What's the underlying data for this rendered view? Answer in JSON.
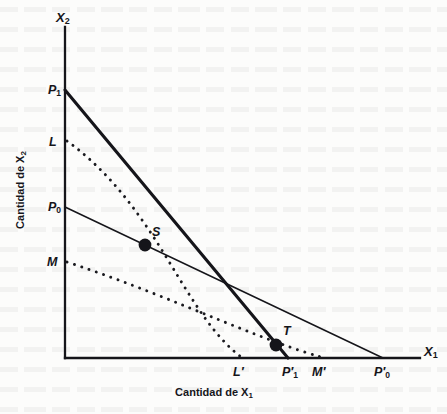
{
  "figure": {
    "kind": "economics-indifference-curve-diagram",
    "background_color": "#fcfcfb",
    "ink_color": "#15151a"
  },
  "axes": {
    "x_axis_variable": "X",
    "x_axis_variable_sub": "1",
    "y_axis_variable": "X",
    "y_axis_variable_sub": "2",
    "x_axis_title": "Cantidad de X",
    "x_axis_title_sub": "1",
    "y_axis_title": "Cantidad de X",
    "y_axis_title_sub": "2",
    "origin_px": [
      65,
      358
    ],
    "x_axis_end_px": [
      420,
      358
    ],
    "y_axis_top_px": [
      65,
      27
    ]
  },
  "y_marks": [
    {
      "id": "P1",
      "label": "P",
      "sub": "1",
      "prime": "",
      "x": 48,
      "y": 84
    },
    {
      "id": "L",
      "label": "L",
      "sub": "",
      "prime": "",
      "x": 49,
      "y": 136
    },
    {
      "id": "P0",
      "label": "P",
      "sub": "0",
      "prime": "",
      "x": 48,
      "y": 201
    },
    {
      "id": "M",
      "label": "M",
      "sub": "",
      "prime": "",
      "x": 47,
      "y": 256
    }
  ],
  "x_marks": [
    {
      "id": "Lp",
      "label": "L",
      "sub": "",
      "prime": "′",
      "x": 233,
      "y": 366
    },
    {
      "id": "P1p",
      "label": "P",
      "sub": "1",
      "prime": "′",
      "x": 282,
      "y": 366
    },
    {
      "id": "Mp",
      "label": "M",
      "sub": "",
      "prime": "′",
      "x": 312,
      "y": 366
    },
    {
      "id": "P0p",
      "label": "P",
      "sub": "0",
      "prime": "′",
      "x": 374,
      "y": 366
    }
  ],
  "budget_lines": [
    {
      "name": "budget-line-P1",
      "label": "P1 P1-prime",
      "from_px": [
        65,
        90
      ],
      "to_px": [
        288,
        358
      ],
      "stroke_width": 3.1,
      "color": "#15151a"
    },
    {
      "name": "budget-line-P0",
      "label": "P0 P0-prime",
      "from_px": [
        65,
        207
      ],
      "to_px": [
        383,
        358
      ],
      "stroke_width": 1.5,
      "color": "#15151a"
    }
  ],
  "indifference_curves": [
    {
      "name": "indifference-curve-L",
      "label": "L L-prime",
      "path": "M 67,141 C 110,172 140,214 168,260 C 196,306 214,336 241,357",
      "dash": "0.1,7.2",
      "stroke_width": 2.9,
      "color": "#1a1a1f"
    },
    {
      "name": "indifference-curve-M",
      "label": "M M-prime",
      "path": "M 67,262 C 128,282 177,303 222,321 C 264,338 296,350 321,357",
      "dash": "0.1,7.6",
      "stroke_width": 2.9,
      "color": "#1a1a1f"
    }
  ],
  "points": [
    {
      "id": "S",
      "label": "S",
      "cx": 145,
      "cy": 245,
      "r": 6.4,
      "label_x": 152,
      "label_y": 226
    },
    {
      "id": "T",
      "label": "T",
      "cx": 276,
      "cy": 345,
      "r": 6.4,
      "label_x": 283,
      "label_y": 325
    }
  ],
  "axis_var_positions": {
    "x_var_x": 424,
    "x_var_y": 345,
    "y_var_x": 56,
    "y_var_y": 11
  },
  "x_axis_title_position": {
    "x": 214,
    "y": 387
  }
}
